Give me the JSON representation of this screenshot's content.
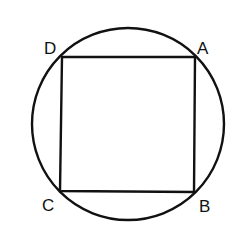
{
  "diagram": {
    "type": "square inscribed in circle",
    "stroke_color": "#111111",
    "background": "#ffffff",
    "circle": {
      "cx": 128,
      "cy": 124,
      "r": 96
    },
    "square": {
      "vertices": {
        "A": {
          "x": 195,
          "y": 57
        },
        "B": {
          "x": 194,
          "y": 192
        },
        "C": {
          "x": 60,
          "y": 191
        },
        "D": {
          "x": 62,
          "y": 57
        }
      }
    },
    "labels": {
      "A": "A",
      "B": "B",
      "C": "C",
      "D": "D"
    }
  }
}
